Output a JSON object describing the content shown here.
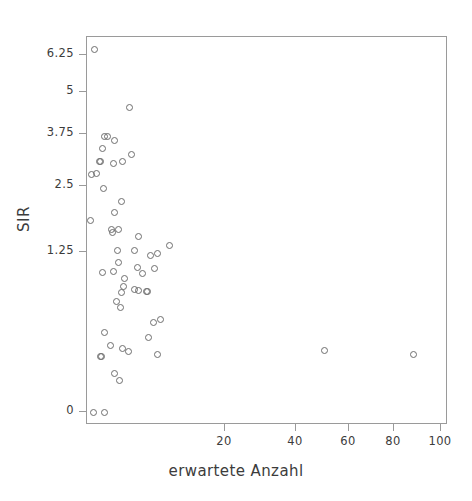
{
  "chart_data": {
    "type": "scatter",
    "title": "",
    "xlabel": "erwartete Anzahl",
    "ylabel": "SIR",
    "xticks": [
      20,
      40,
      60,
      80,
      100
    ],
    "xtick_labels": [
      "20",
      "40",
      "60",
      "80",
      "100"
    ],
    "yticks": [
      0,
      1.25,
      2.5,
      3.75,
      5,
      6.25
    ],
    "ytick_labels": [
      "0",
      "1.25",
      "2.5",
      "3.75",
      "5",
      "6.25"
    ],
    "xlim": [
      0,
      107
    ],
    "ylim": [
      0,
      6.7
    ],
    "grid": false,
    "legend": null,
    "marker": "open-circle",
    "marker_color": "#6e6e6e",
    "frame_color": "#9a9a9a",
    "background": "#ffffff",
    "n_points": 70,
    "points": [
      {
        "x": 1.1,
        "y": 6.45
      },
      {
        "x": 6.2,
        "y": 4.55
      },
      {
        "x": 2.6,
        "y": 3.68
      },
      {
        "x": 2.9,
        "y": 3.7
      },
      {
        "x": 4.0,
        "y": 3.6
      },
      {
        "x": 2.3,
        "y": 3.4
      },
      {
        "x": 6.5,
        "y": 3.25
      },
      {
        "x": 1.8,
        "y": 3.1
      },
      {
        "x": 2.0,
        "y": 3.1
      },
      {
        "x": 3.9,
        "y": 3.05
      },
      {
        "x": 5.2,
        "y": 3.1
      },
      {
        "x": 0.6,
        "y": 2.78
      },
      {
        "x": 1.4,
        "y": 2.8
      },
      {
        "x": 2.4,
        "y": 2.45
      },
      {
        "x": 5.0,
        "y": 2.2
      },
      {
        "x": 4.0,
        "y": 2.0
      },
      {
        "x": 0.5,
        "y": 1.85
      },
      {
        "x": 3.6,
        "y": 1.68
      },
      {
        "x": 3.7,
        "y": 1.62
      },
      {
        "x": 4.6,
        "y": 1.67
      },
      {
        "x": 7.4,
        "y": 1.55
      },
      {
        "x": 11.9,
        "y": 1.38
      },
      {
        "x": 4.4,
        "y": 1.28
      },
      {
        "x": 6.9,
        "y": 1.27
      },
      {
        "x": 9.2,
        "y": 1.22
      },
      {
        "x": 10.2,
        "y": 1.24
      },
      {
        "x": 4.5,
        "y": 1.17
      },
      {
        "x": 7.3,
        "y": 1.13
      },
      {
        "x": 9.8,
        "y": 1.12
      },
      {
        "x": 2.2,
        "y": 1.09
      },
      {
        "x": 3.8,
        "y": 1.1
      },
      {
        "x": 8.0,
        "y": 1.08
      },
      {
        "x": 5.5,
        "y": 1.04
      },
      {
        "x": 5.3,
        "y": 0.98
      },
      {
        "x": 6.9,
        "y": 0.96
      },
      {
        "x": 7.4,
        "y": 0.95
      },
      {
        "x": 5.0,
        "y": 0.93
      },
      {
        "x": 8.6,
        "y": 0.94
      },
      {
        "x": 8.7,
        "y": 0.94
      },
      {
        "x": 4.3,
        "y": 0.86
      },
      {
        "x": 4.8,
        "y": 0.82
      },
      {
        "x": 9.6,
        "y": 0.7
      },
      {
        "x": 10.6,
        "y": 0.72
      },
      {
        "x": 2.6,
        "y": 0.62
      },
      {
        "x": 8.9,
        "y": 0.58
      },
      {
        "x": 3.4,
        "y": 0.52
      },
      {
        "x": 5.1,
        "y": 0.5
      },
      {
        "x": 6.0,
        "y": 0.47
      },
      {
        "x": 10.2,
        "y": 0.45
      },
      {
        "x": 50.8,
        "y": 0.48
      },
      {
        "x": 88.5,
        "y": 0.45
      },
      {
        "x": 2.0,
        "y": 0.43
      },
      {
        "x": 2.1,
        "y": 0.43
      },
      {
        "x": 4.0,
        "y": 0.3
      },
      {
        "x": 4.7,
        "y": 0.25
      },
      {
        "x": 0.9,
        "y": 0.0
      },
      {
        "x": 2.6,
        "y": 0.0
      }
    ]
  }
}
